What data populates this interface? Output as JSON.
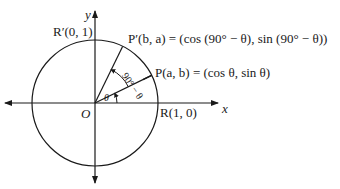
{
  "diagram": {
    "type": "unit-circle",
    "origin_label": "O",
    "x_axis_label": "x",
    "y_axis_label": "y",
    "points": {
      "R": "R(1, 0)",
      "R_prime": "R′(0, 1)",
      "P": "P(a, b) = (cos θ, sin θ)",
      "P_prime": "P′(b, a) = (cos (90° − θ), sin (90° − θ))"
    },
    "angles": {
      "theta": "θ",
      "complement": "90° − θ"
    },
    "colors": {
      "stroke": "#1a1a1a",
      "background": "#ffffff"
    }
  }
}
